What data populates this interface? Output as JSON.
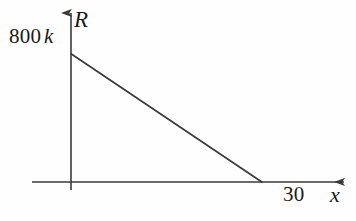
{
  "figure": {
    "background_color": "#fefefe",
    "stroke_color": "#3a3a3a",
    "text_color": "#1a1a1a"
  },
  "labels": {
    "y_intercept_value": "800",
    "y_intercept_unit": "k",
    "y_axis_name": "R",
    "x_intercept_value": "30",
    "x_axis_name": "x"
  },
  "chart_data": {
    "type": "line",
    "title": "",
    "xlabel": "x",
    "ylabel": "R",
    "x": [
      0,
      30
    ],
    "values": [
      800000,
      0
    ],
    "series": [
      {
        "name": "R(x)",
        "x": [
          0,
          30
        ],
        "values": [
          800000,
          0
        ]
      }
    ],
    "tick_labels": {
      "x": [
        "30"
      ],
      "y": [
        "800 k"
      ]
    },
    "annotations": [
      "y-intercept labeled 800 k",
      "x-intercept labeled 30"
    ],
    "xlim": [
      0,
      36
    ],
    "ylim": [
      0,
      880000
    ],
    "grid": false,
    "legend": false,
    "axis_arrows": true,
    "line_color": "#3a3a3a"
  }
}
